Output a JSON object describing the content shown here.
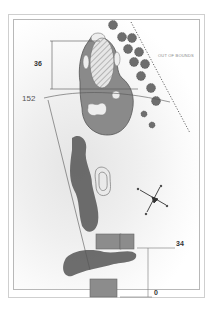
{
  "diagram": {
    "type": "golf-hole-layout",
    "labels": {
      "out_of_bounds": "OUT OF BOUNDS",
      "green_depth": "36",
      "distance_to_green": "152",
      "tee_forward": "34",
      "tee_back": "0"
    },
    "colors": {
      "fairway": "#8a8a8a",
      "fairway_stroke": "#555555",
      "bunker": "#eeeeee",
      "green_hatch": "#bdbdbd",
      "tee_box": "#8c8c8c",
      "trees": "#666666",
      "frame": "#b8b8b8"
    },
    "features": [
      "green",
      "fairway",
      "bunkers",
      "tree-line",
      "out-of-bounds-line",
      "water-hazard-contour",
      "compass-rose",
      "forward-tee",
      "back-tee",
      "shrub-rough"
    ]
  }
}
